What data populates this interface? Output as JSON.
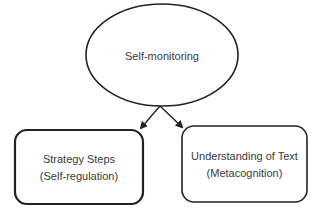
{
  "diagram": {
    "top_node": {
      "label": "Self-monitoring",
      "shape": "ellipse"
    },
    "left_node": {
      "line1": "Strategy Steps",
      "line2": "(Self-regulation)",
      "shape": "rounded-rectangle"
    },
    "right_node": {
      "line1": "Understanding of Text",
      "line2": "(Metacognition)",
      "shape": "rounded-rectangle"
    },
    "edges": [
      {
        "from": "Self-monitoring",
        "to": "Strategy Steps (Self-regulation)"
      },
      {
        "from": "Self-monitoring",
        "to": "Understanding of Text (Metacognition)"
      }
    ],
    "colors": {
      "stroke": "#222222",
      "text": "#3a3a3a",
      "background": "#ffffff"
    }
  }
}
